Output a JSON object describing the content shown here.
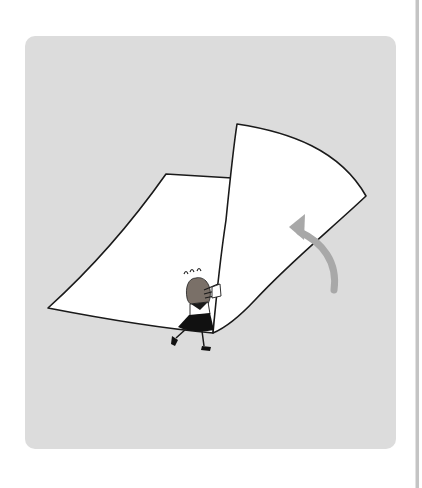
{
  "page": {
    "background": "#ffffff"
  },
  "illustration": {
    "alt": "Girl pushing a huge sheet of paper to turn it over, with a gray curved arrow showing the page being flipped",
    "card_color": "#dcdcdc",
    "paper_color": "#ffffff",
    "outline_color": "#1a1a1a",
    "arrow_color": "#a8a8a8",
    "hair_color": "#7a7068",
    "skirt_color": "#111111"
  },
  "scrollbar": {
    "color": "#c4c4c4"
  }
}
